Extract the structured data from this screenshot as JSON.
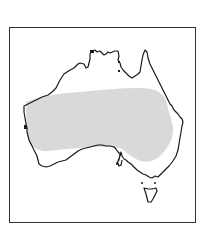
{
  "map": {
    "subject": "Australia",
    "style": "outline map with shaded distribution range",
    "colors": {
      "background": "#ffffff",
      "frame": "#333333",
      "coastline": "#1a1a1a",
      "range_fill": "#d9d9d9"
    },
    "regions": [
      {
        "name": "Australia mainland",
        "type": "coastline"
      },
      {
        "name": "Tasmania",
        "type": "coastline"
      },
      {
        "name": "distribution range",
        "type": "shaded-area",
        "extent": "central and western arid interior"
      }
    ]
  }
}
